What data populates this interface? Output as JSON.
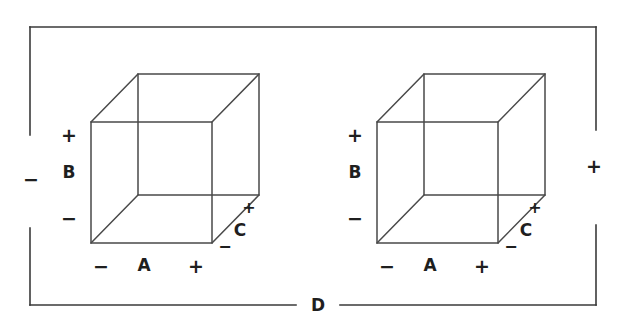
{
  "figure": {
    "background_color": "#ffffff",
    "line_color": "#3a3a3a",
    "cube_edge_color": "#4a4a4a",
    "text_color": "#1f1f1f"
  },
  "outer_axis": {
    "label": "D",
    "minus": "−",
    "plus": "+"
  },
  "cubes": [
    {
      "id": "left-cube",
      "axes": {
        "horizontal": {
          "label": "A",
          "minus": "−",
          "plus": "+"
        },
        "vertical": {
          "label": "B",
          "minus": "−",
          "plus": "+"
        },
        "depth": {
          "label": "C",
          "minus": "−",
          "plus": "+"
        }
      }
    },
    {
      "id": "right-cube",
      "axes": {
        "horizontal": {
          "label": "A",
          "minus": "−",
          "plus": "+"
        },
        "vertical": {
          "label": "B",
          "minus": "−",
          "plus": "+"
        },
        "depth": {
          "label": "C",
          "minus": "−",
          "plus": "+"
        }
      }
    }
  ]
}
